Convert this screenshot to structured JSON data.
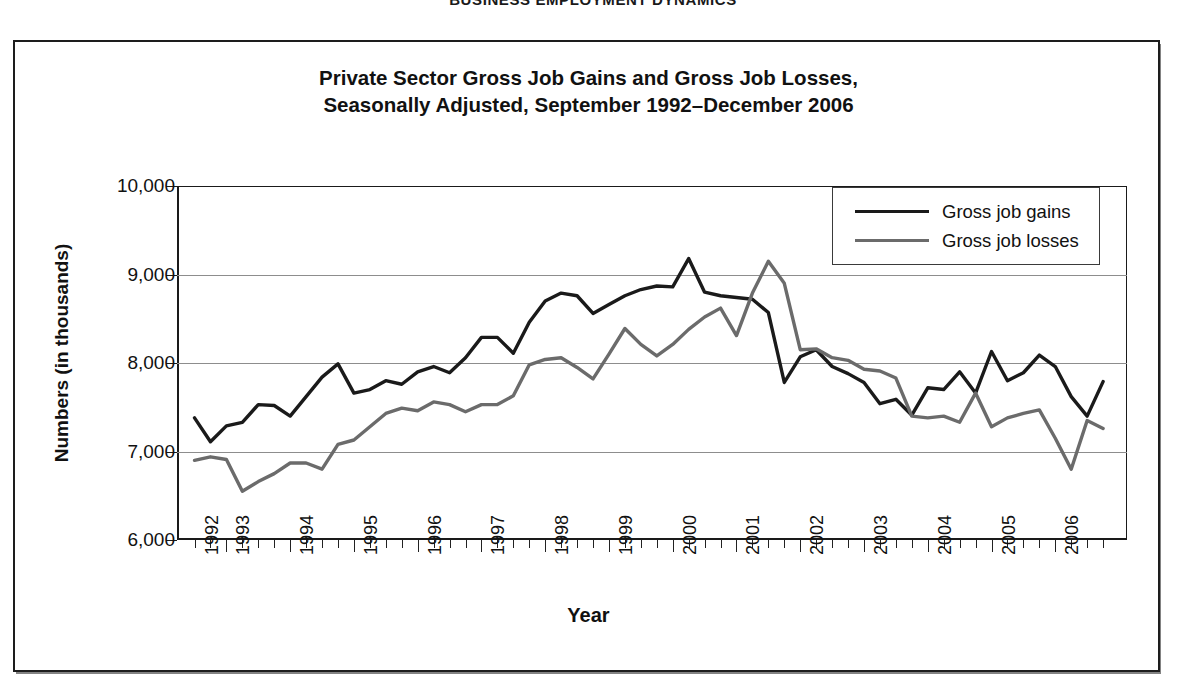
{
  "page_header": "BUSINESS EMPLOYMENT DYNAMICS",
  "figure": {
    "title_line_1": "Private Sector Gross Job Gains and Gross Job Losses,",
    "title_line_2": "Seasonally Adjusted, September 1992–December 2006"
  },
  "legend": {
    "position": "top-right-inside",
    "entries": [
      {
        "label": "Gross job gains",
        "color": "#1a1a1a"
      },
      {
        "label": "Gross job losses",
        "color": "#6b6b6b"
      }
    ]
  },
  "axes": {
    "y_title": "Numbers (in thousands)",
    "x_title": "Year",
    "y_ticks": [
      "10,000",
      "9,000",
      "8,000",
      "7,000",
      "6,000"
    ],
    "x_ticks": [
      "1992",
      "1993",
      "1994",
      "1995",
      "1996",
      "1997",
      "1998",
      "1999",
      "2000",
      "2001",
      "2002",
      "2003",
      "2004",
      "2005",
      "2006"
    ]
  },
  "chart_data": {
    "type": "line",
    "title": "Private Sector Gross Job Gains and Gross Job Losses, Seasonally Adjusted, September 1992–December 2006",
    "xlabel": "Year",
    "ylabel": "Numbers (in thousands)",
    "ylim": [
      6000,
      10000
    ],
    "ytick_values": [
      6000,
      7000,
      8000,
      9000,
      10000
    ],
    "grid": "horizontal",
    "legend_position": "top-right",
    "x_axis_type": "quarterly",
    "x_start": "1992 Q3",
    "x_end": "2006 Q4",
    "x_tick_labels": [
      "1992",
      "1993",
      "1994",
      "1995",
      "1996",
      "1997",
      "1998",
      "1999",
      "2000",
      "2001",
      "2002",
      "2003",
      "2004",
      "2005",
      "2006"
    ],
    "x": [
      "1992Q3",
      "1992Q4",
      "1993Q1",
      "1993Q2",
      "1993Q3",
      "1993Q4",
      "1994Q1",
      "1994Q2",
      "1994Q3",
      "1994Q4",
      "1995Q1",
      "1995Q2",
      "1995Q3",
      "1995Q4",
      "1996Q1",
      "1996Q2",
      "1996Q3",
      "1996Q4",
      "1997Q1",
      "1997Q2",
      "1997Q3",
      "1997Q4",
      "1998Q1",
      "1998Q2",
      "1998Q3",
      "1998Q4",
      "1999Q1",
      "1999Q2",
      "1999Q3",
      "1999Q4",
      "2000Q1",
      "2000Q2",
      "2000Q3",
      "2000Q4",
      "2001Q1",
      "2001Q2",
      "2001Q3",
      "2001Q4",
      "2002Q1",
      "2002Q2",
      "2002Q3",
      "2002Q4",
      "2003Q1",
      "2003Q2",
      "2003Q3",
      "2003Q4",
      "2004Q1",
      "2004Q2",
      "2004Q3",
      "2004Q4",
      "2005Q1",
      "2005Q2",
      "2005Q3",
      "2005Q4",
      "2006Q1",
      "2006Q2",
      "2006Q3",
      "2006Q4"
    ],
    "series": [
      {
        "name": "Gross job gains",
        "color": "#1a1a1a",
        "values": [
          7380,
          7110,
          7290,
          7330,
          7530,
          7520,
          7400,
          7620,
          7840,
          7990,
          7660,
          7700,
          7800,
          7760,
          7900,
          7960,
          7890,
          8060,
          8290,
          8290,
          8110,
          8460,
          8700,
          8790,
          8760,
          8560,
          8660,
          8760,
          8830,
          8870,
          8860,
          9180,
          8800,
          8760,
          8740,
          8720,
          8570,
          7780,
          8070,
          8150,
          7960,
          7880,
          7780,
          7540,
          7590,
          7410,
          7720,
          7700,
          7900,
          7660,
          8130,
          7800,
          7890,
          8090,
          7960,
          7620,
          7400,
          7790
        ]
      },
      {
        "name": "Gross job losses",
        "color": "#6b6b6b",
        "values": [
          6900,
          6940,
          6910,
          6550,
          6660,
          6750,
          6870,
          6870,
          6800,
          7080,
          7130,
          7280,
          7430,
          7490,
          7460,
          7560,
          7530,
          7450,
          7530,
          7530,
          7630,
          7980,
          8040,
          8060,
          7950,
          7820,
          8100,
          8390,
          8210,
          8080,
          8210,
          8380,
          8520,
          8620,
          8310,
          8790,
          9150,
          8900,
          8150,
          8160,
          8060,
          8030,
          7930,
          7910,
          7830,
          7400,
          7380,
          7400,
          7330,
          7660,
          7280,
          7380,
          7430,
          7470,
          7150,
          6800,
          7350,
          7260
        ]
      }
    ]
  }
}
